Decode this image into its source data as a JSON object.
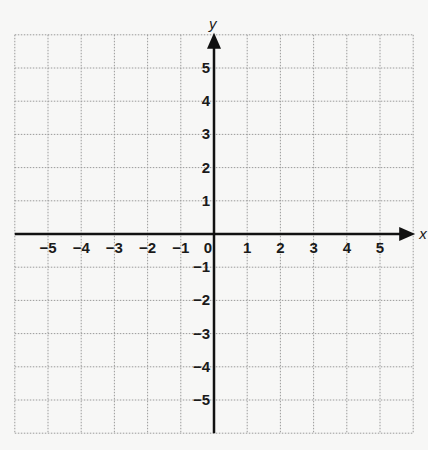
{
  "chart_data": {
    "type": "coordinate-grid",
    "title": "",
    "xlabel": "x",
    "ylabel": "y",
    "xlim": [
      -6,
      6
    ],
    "ylim": [
      -6,
      6
    ],
    "grid": true,
    "grid_style": "dotted",
    "x_ticks": [
      -5,
      -4,
      -3,
      -2,
      -1,
      0,
      1,
      2,
      3,
      4,
      5
    ],
    "y_ticks": [
      -5,
      -4,
      -3,
      -2,
      -1,
      1,
      2,
      3,
      4,
      5
    ],
    "x_tick_labels": [
      "−5",
      "−4",
      "−3",
      "−2",
      "−1",
      "0",
      "1",
      "2",
      "3",
      "4",
      "5"
    ],
    "y_tick_labels": [
      "−5",
      "−4",
      "−3",
      "−2",
      "−1",
      "1",
      "2",
      "3",
      "4",
      "5"
    ],
    "origin_label": "0",
    "series": [],
    "arrows": {
      "x_positive": true,
      "y_positive": true
    }
  },
  "colors": {
    "background": "#f7f7f6",
    "grid": "#9a9a9a",
    "axis": "#111111",
    "text": "#1a1a1a"
  }
}
